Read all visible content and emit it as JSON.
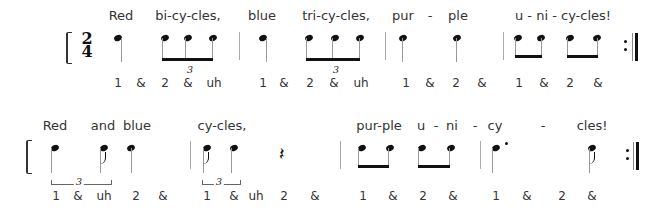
{
  "time_signature": {
    "top": "2",
    "bottom": "4"
  },
  "rows": [
    {
      "lyrics": [
        {
          "text": "Red",
          "x": 121
        },
        {
          "text": "bi-cy-cles,",
          "x": 188
        },
        {
          "text": "blue",
          "x": 262
        },
        {
          "text": "tri-cy-cles,",
          "x": 336
        },
        {
          "text": "pur",
          "x": 403
        },
        {
          "text": "-",
          "x": 430
        },
        {
          "text": "ple",
          "x": 458
        },
        {
          "text": "u - ni - cy-cles!",
          "x": 563
        }
      ],
      "counts": [
        {
          "text": "1",
          "x": 118
        },
        {
          "text": "&",
          "x": 141
        },
        {
          "text": "2",
          "x": 165
        },
        {
          "text": "&",
          "x": 188
        },
        {
          "text": "uh",
          "x": 214
        },
        {
          "text": "1",
          "x": 263
        },
        {
          "text": "&",
          "x": 284
        },
        {
          "text": "2",
          "x": 310
        },
        {
          "text": "&",
          "x": 334
        },
        {
          "text": "uh",
          "x": 361
        },
        {
          "text": "1",
          "x": 406
        },
        {
          "text": "&",
          "x": 430
        },
        {
          "text": "2",
          "x": 456
        },
        {
          "text": "&",
          "x": 482
        },
        {
          "text": "1",
          "x": 519
        },
        {
          "text": "&",
          "x": 544
        },
        {
          "text": "2",
          "x": 570
        },
        {
          "text": "&",
          "x": 598
        }
      ],
      "tuplets": [
        {
          "label": "3",
          "x": 190
        },
        {
          "label": "3",
          "x": 336
        }
      ]
    },
    {
      "lyrics": [
        {
          "text": "Red",
          "x": 55
        },
        {
          "text": "and",
          "x": 103
        },
        {
          "text": "blue",
          "x": 137
        },
        {
          "text": "cy-cles,",
          "x": 222
        },
        {
          "text": "pur-ple",
          "x": 379
        },
        {
          "text": "u",
          "x": 421
        },
        {
          "text": "-",
          "x": 436
        },
        {
          "text": "ni",
          "x": 452
        },
        {
          "text": "-",
          "x": 475
        },
        {
          "text": "cy",
          "x": 495
        },
        {
          "text": "-",
          "x": 543
        },
        {
          "text": "cles!",
          "x": 592
        }
      ],
      "counts": [
        {
          "text": "1",
          "x": 56
        },
        {
          "text": "&",
          "x": 78
        },
        {
          "text": "uh",
          "x": 104
        },
        {
          "text": "2",
          "x": 136
        },
        {
          "text": "&",
          "x": 163
        },
        {
          "text": "1",
          "x": 207
        },
        {
          "text": "&",
          "x": 234
        },
        {
          "text": "uh",
          "x": 256
        },
        {
          "text": "2",
          "x": 284
        },
        {
          "text": "&",
          "x": 315
        },
        {
          "text": "1",
          "x": 363
        },
        {
          "text": "&",
          "x": 393
        },
        {
          "text": "2",
          "x": 423
        },
        {
          "text": "&",
          "x": 453
        },
        {
          "text": "1",
          "x": 496
        },
        {
          "text": "&",
          "x": 527
        },
        {
          "text": "2",
          "x": 562
        },
        {
          "text": "&",
          "x": 592
        }
      ],
      "tuplets": [
        {
          "label": "3",
          "x": 79
        },
        {
          "label": "3",
          "x": 219
        }
      ]
    }
  ]
}
